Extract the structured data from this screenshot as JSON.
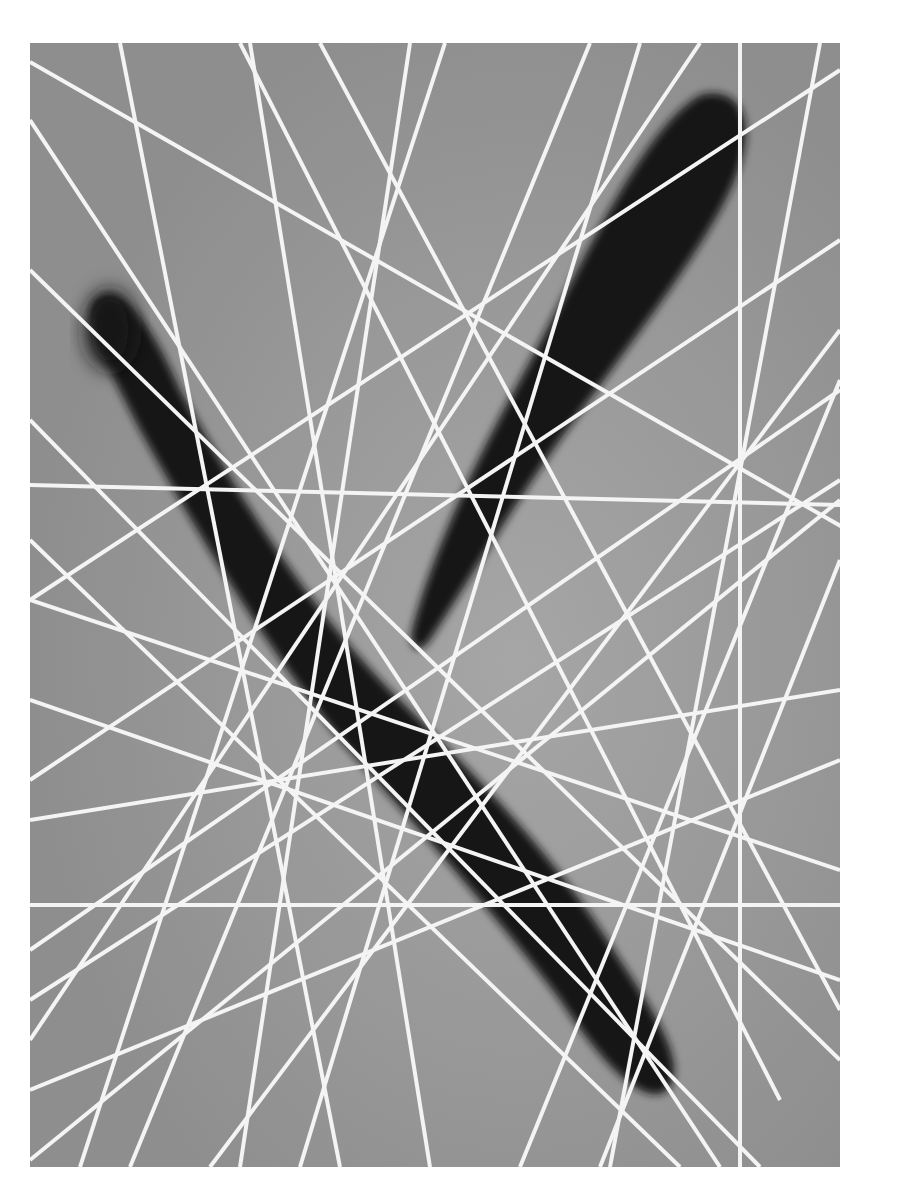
{
  "artwork": {
    "description": "Abstract photogram: two dark blurred elongated shapes crossed by many straight white lines forming an envelope around an oval",
    "background_color": "#ffffff",
    "field_color": "#9a9a9a",
    "shape_color": "#151515",
    "line_color": "#f4f4f4"
  }
}
